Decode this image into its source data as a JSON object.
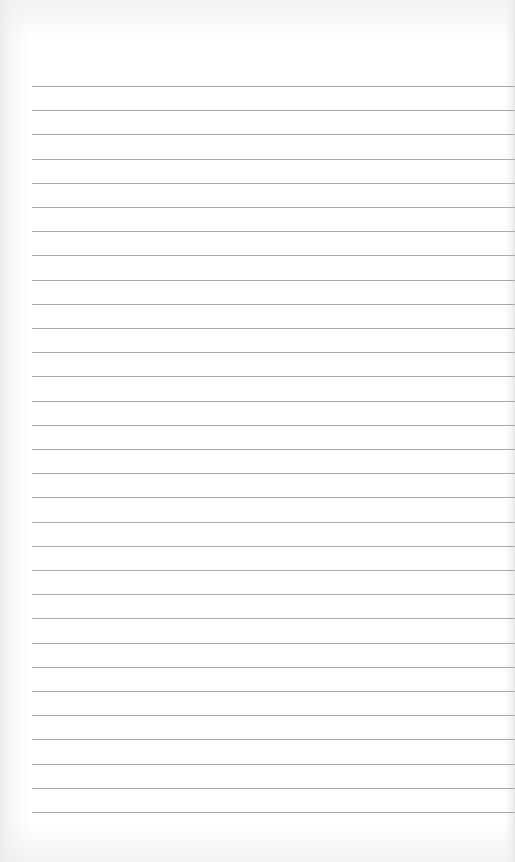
{
  "document": {
    "type": "lined-notebook-page",
    "ruled_lines": {
      "count": 31,
      "first_y": 86,
      "spacing": 24.2,
      "left_x": 32,
      "color": "#a9a9a9"
    },
    "text_content": []
  }
}
